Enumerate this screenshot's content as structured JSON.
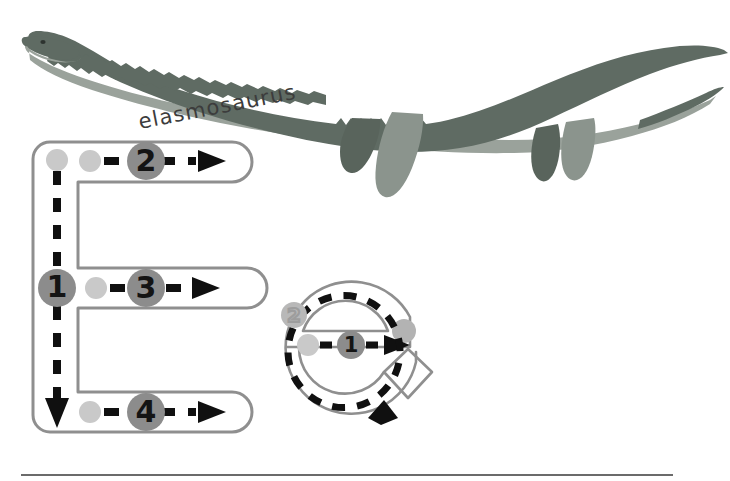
{
  "page": {
    "background_color": "#ffffff",
    "width": 730,
    "height": 481
  },
  "illustration": {
    "name": "elasmosaurus",
    "caption": "elasmosaurus",
    "caption_style": "handwritten",
    "body_color": "#5f6b63",
    "belly_color": "#9aa29b",
    "flipper_dark_color": "#59645c",
    "flipper_light_color": "#8b948d",
    "eye_color": "#2d332f"
  },
  "tracing": {
    "uppercase": {
      "letter": "E",
      "outline_color": "#8f8f8f",
      "dash_color": "#101010",
      "start_dot_color": "#c9c9c9",
      "step_circle_color": "#8c8c8c",
      "steps": [
        {
          "number": "1",
          "direction": "down",
          "description": "vertical stroke, top to bottom"
        },
        {
          "number": "2",
          "direction": "right",
          "description": "top horizontal arm, left to right"
        },
        {
          "number": "3",
          "direction": "right",
          "description": "middle horizontal arm, left to right"
        },
        {
          "number": "4",
          "direction": "right",
          "description": "bottom horizontal arm, left to right"
        }
      ]
    },
    "lowercase": {
      "letter": "e",
      "outline_color": "#8f8f8f",
      "dash_color": "#101010",
      "start_dot_color": "#c9c9c9",
      "step_circle_color": "#8c8c8c",
      "ghost_circle_color": "#a8a8a8",
      "steps": [
        {
          "number": "1",
          "direction": "right",
          "description": "horizontal bar, left to right"
        },
        {
          "number": "2",
          "direction": "counterclockwise",
          "description": "loop around, over the top and down around to the right"
        }
      ]
    }
  },
  "footer": {
    "rule_color": "#3a3a3a",
    "rule_label": "bottom rule line"
  }
}
